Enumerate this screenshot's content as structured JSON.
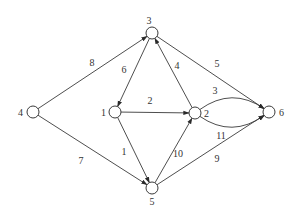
{
  "title": "",
  "colors": {
    "stroke": "#3a3a3a",
    "text": "#333333",
    "background": "#ffffff"
  },
  "graph": {
    "directed": true,
    "nodes": [
      {
        "id": "1",
        "label": "1"
      },
      {
        "id": "2",
        "label": "2"
      },
      {
        "id": "3",
        "label": "3"
      },
      {
        "id": "4",
        "label": "4"
      },
      {
        "id": "5",
        "label": "5"
      },
      {
        "id": "6",
        "label": "6"
      }
    ],
    "edges": [
      {
        "from": "4",
        "to": "3",
        "weight": "8"
      },
      {
        "from": "3",
        "to": "1",
        "weight": "6"
      },
      {
        "from": "2",
        "to": "3",
        "weight": "4"
      },
      {
        "from": "3",
        "to": "6",
        "weight": "5"
      },
      {
        "from": "1",
        "to": "2",
        "weight": "2"
      },
      {
        "from": "2",
        "to": "6",
        "weight": "3",
        "curve": "upper"
      },
      {
        "from": "2",
        "to": "6",
        "weight": "11",
        "curve": "lower"
      },
      {
        "from": "1",
        "to": "5",
        "weight": "1"
      },
      {
        "from": "4",
        "to": "5",
        "weight": "7"
      },
      {
        "from": "5",
        "to": "2",
        "weight": "10"
      },
      {
        "from": "5",
        "to": "6",
        "weight": "9"
      }
    ]
  }
}
